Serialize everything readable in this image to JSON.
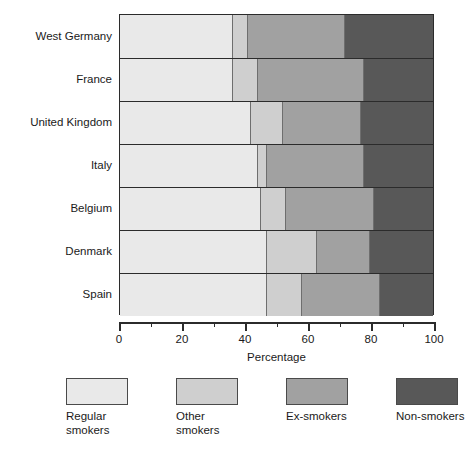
{
  "chart_data": {
    "type": "bar",
    "subtype": "horizontal-stacked-100",
    "title": "",
    "xlabel": "Percentage",
    "ylabel": "",
    "xlim": [
      0,
      100
    ],
    "xticks": [
      0,
      20,
      40,
      60,
      80,
      100
    ],
    "xtick_labels": [
      "0",
      "20",
      "40",
      "60",
      "80",
      "100"
    ],
    "minor_tick_interval": 10,
    "grid": false,
    "legend_position": "bottom",
    "categories": [
      "West Germany",
      "France",
      "United Kingdom",
      "Italy",
      "Belgium",
      "Denmark",
      "Spain"
    ],
    "series": [
      {
        "name": "Regular smokers",
        "color": "#e9e9e9",
        "values": [
          36,
          36,
          42,
          44,
          45,
          47,
          47
        ]
      },
      {
        "name": "Other smokers",
        "color": "#cfcfcf",
        "values": [
          5,
          8,
          10,
          3,
          8,
          16,
          11
        ]
      },
      {
        "name": "Ex-smokers",
        "color": "#a1a1a1",
        "values": [
          31,
          34,
          25,
          31,
          28,
          17,
          25
        ]
      },
      {
        "name": "Non-smokers",
        "color": "#585858",
        "values": [
          28,
          22,
          23,
          22,
          19,
          20,
          17
        ]
      }
    ]
  },
  "legend": {
    "items": [
      {
        "label": "Regular\nsmokers",
        "color": "#e9e9e9"
      },
      {
        "label": "Other\nsmokers",
        "color": "#cfcfcf"
      },
      {
        "label": "Ex-smokers",
        "color": "#a1a1a1"
      },
      {
        "label": "Non-smokers",
        "color": "#585858"
      }
    ]
  },
  "axis": {
    "x_title": "Percentage"
  }
}
